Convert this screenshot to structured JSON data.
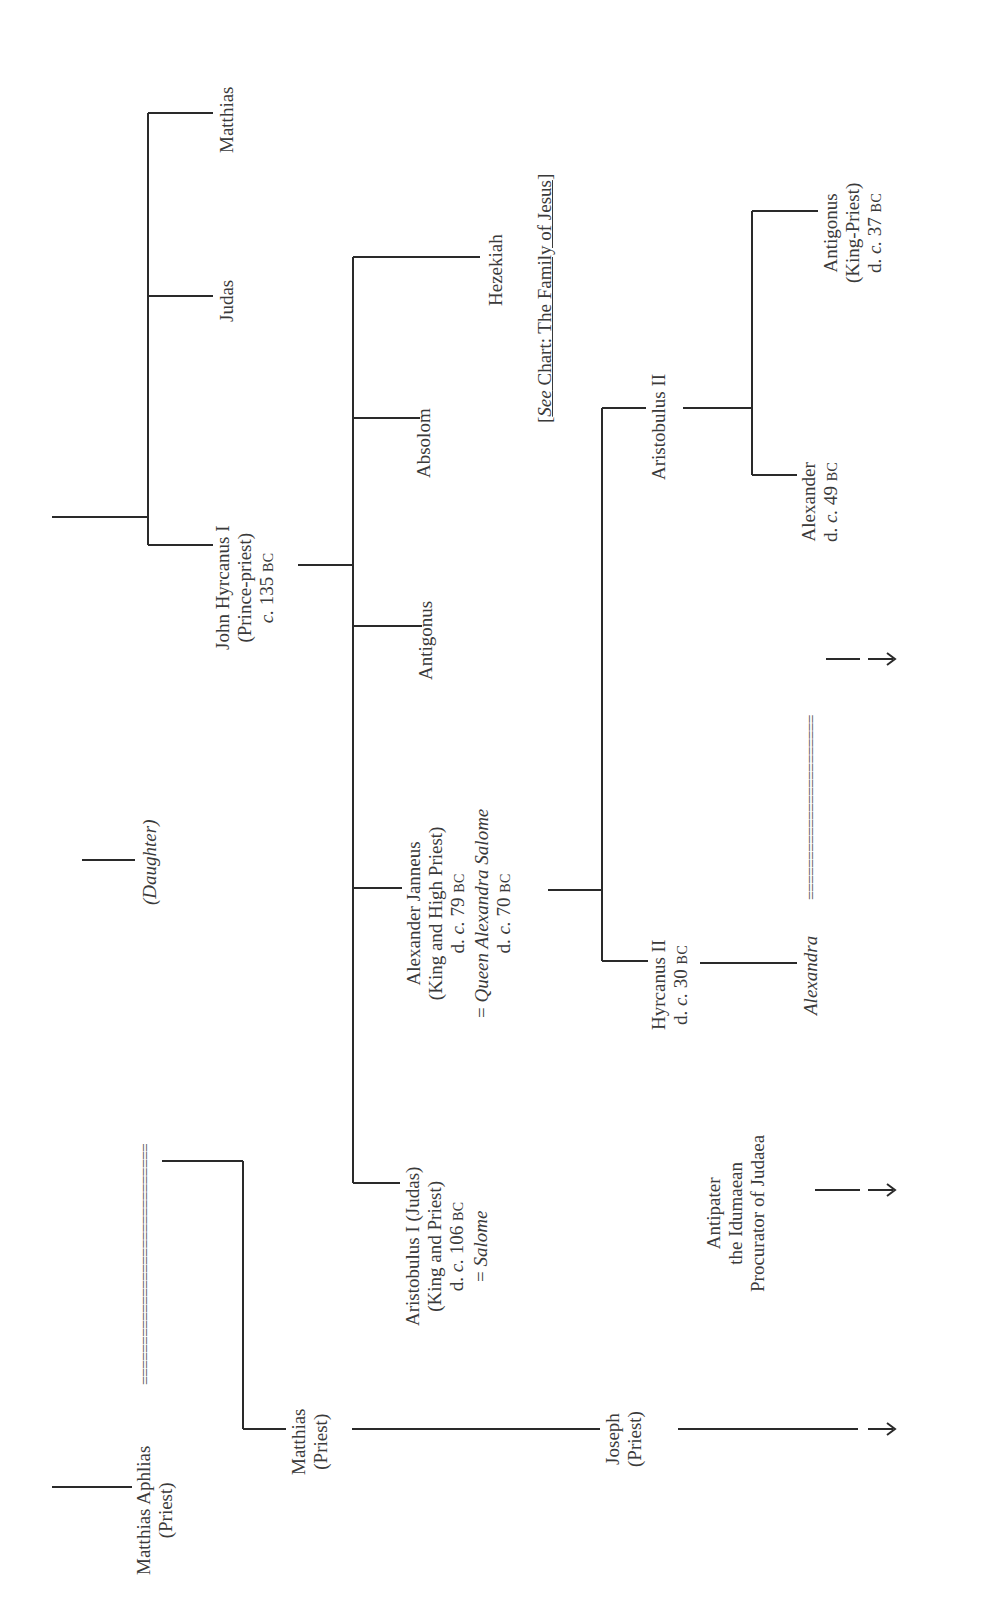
{
  "diagram": {
    "type": "genealogy-tree",
    "orientation": "rotated-90-ccw",
    "people": {
      "matthias_aphlias": {
        "name": "Matthias Aphlias",
        "role": "(Priest)"
      },
      "daughter": {
        "name": "(Daughter)"
      },
      "matthias_priest": {
        "name": "Matthias",
        "role": "(Priest)"
      },
      "joseph": {
        "name": "Joseph",
        "role": "(Priest)"
      },
      "john_hyrcanus": {
        "name": "John Hyrcanus I",
        "role": "(Prince-priest)",
        "date_c": "c.",
        "date": " 135 ",
        "era": "BC"
      },
      "judas": {
        "name": "Judas"
      },
      "matthias_son": {
        "name": "Matthias"
      },
      "aristobulus_i": {
        "name": "Aristobulus I (Judas)",
        "role": "(King and Priest)",
        "death_prefix": "d. ",
        "date_c": "c.",
        "date": " 106 ",
        "era": "BC",
        "spouse_prefix": "= ",
        "spouse": "Salome"
      },
      "alexander_janneus": {
        "name": "Alexander Janneus",
        "role": "(King and High Priest)",
        "death_prefix": "d. ",
        "date_c": "c.",
        "date": " 79 ",
        "era": "BC",
        "spouse_prefix": "= ",
        "spouse": "Queen Alexandra Salome",
        "spouse_death_prefix": "d. ",
        "spouse_date_c": "c.",
        "spouse_date": " 70 ",
        "spouse_era": "BC"
      },
      "antigonus": {
        "name": "Antigonus"
      },
      "absolom": {
        "name": "Absolom"
      },
      "hezekiah": {
        "name": "Hezekiah"
      },
      "hyrcanus_ii": {
        "name": "Hyrcanus II",
        "death_prefix": "d. ",
        "date_c": "c.",
        "date": " 30 ",
        "era": "BC"
      },
      "aristobulus_ii": {
        "name": "Aristobulus II"
      },
      "antipater": {
        "line1": "Antipater",
        "line2": "the Idumaean",
        "line3": "Procurator of Judaea"
      },
      "alexandra": {
        "name": "Alexandra"
      },
      "alexander": {
        "name": "Alexander",
        "death_prefix": "d. ",
        "date_c": "c.",
        "date": " 49 ",
        "era": "BC"
      },
      "antigonus_king": {
        "name": "Antigonus",
        "role": "(King-Priest)",
        "death_prefix": "d. ",
        "date_c": "c.",
        "date": " 37 ",
        "era": "BC"
      }
    },
    "marriage_symbol_1": "==============================",
    "marriage_symbol_2": "=======================",
    "reference": {
      "open": "[",
      "see": "See",
      "text": " Chart: The Family of Jesus",
      "close": "]"
    },
    "arrow_glyph": "→"
  }
}
